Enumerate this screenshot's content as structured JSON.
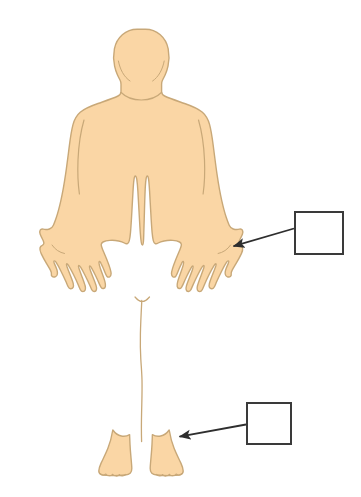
{
  "image": {
    "title": "Human body outline diagram with two blank label boxes",
    "width": 361,
    "height": 497,
    "background_color": "#ffffff"
  },
  "figure": {
    "name": "human-body-front-view",
    "fill_color": "#fad6a5",
    "outline_color": "#c8a878",
    "outline_width": 1.4,
    "detail_line_color": "#c8a878",
    "parts": [
      "head",
      "neck",
      "shoulders",
      "torso",
      "left-arm",
      "right-arm",
      "left-hand",
      "right-hand",
      "left-leg",
      "right-leg",
      "left-foot",
      "right-foot"
    ]
  },
  "annotations": {
    "boxes": [
      {
        "id": "upper",
        "label": "",
        "border_color": "#3a3a3a",
        "fill_color": "#ffffff",
        "x": 294,
        "y": 211,
        "width": 50,
        "height": 44,
        "points_to": "right-hand"
      },
      {
        "id": "lower",
        "label": "",
        "border_color": "#3a3a3a",
        "fill_color": "#ffffff",
        "x": 246,
        "y": 402,
        "width": 46,
        "height": 43,
        "points_to": "right-foot"
      }
    ],
    "arrows": [
      {
        "id": "upper-arrow",
        "color": "#2e2e2e",
        "from_x": 294,
        "from_y": 228,
        "to_x": 230,
        "to_y": 247,
        "target": "right-hand"
      },
      {
        "id": "lower-arrow",
        "color": "#2e2e2e",
        "from_x": 246,
        "from_y": 424,
        "to_x": 176,
        "to_y": 437,
        "target": "right-foot"
      }
    ]
  }
}
